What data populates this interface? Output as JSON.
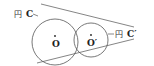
{
  "diagram": {
    "circle_c": {
      "label_prefix": "円",
      "label_name": "C",
      "center_label": "O",
      "cx": 55,
      "cy": 42,
      "r": 23
    },
    "circle_c_prime": {
      "label_prefix": "円",
      "label_name": "C′",
      "center_label": "O′",
      "cx": 91,
      "cy": 40,
      "r": 17
    },
    "tangents": [
      {
        "name": "upper",
        "x1": 41,
        "y1": 4,
        "x2": 134,
        "y2": 27
      },
      {
        "name": "lower",
        "x1": 37,
        "y1": 63,
        "x2": 134,
        "y2": 39
      }
    ],
    "colors": {
      "stroke": "#555555",
      "text": "#222222"
    }
  }
}
